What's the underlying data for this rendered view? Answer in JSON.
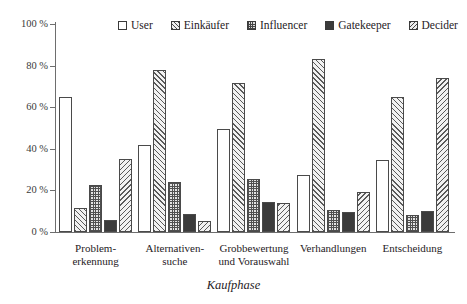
{
  "chart_data": {
    "type": "bar",
    "title": "",
    "subtitle": "",
    "xlabel": "Kaufphase",
    "ylabel": "",
    "ylim": [
      0,
      100
    ],
    "yunit": "%",
    "grid": false,
    "legend_position": "top",
    "categories": [
      "Problem-\nerkennung",
      "Alternativen-\nsuche",
      "Grobbewertung\nund Vorauswahl",
      "Verhandlungen",
      "Entscheidung"
    ],
    "series": [
      {
        "name": "User",
        "pattern": "open",
        "values": [
          65,
          42,
          49.5,
          27.5,
          34.5
        ]
      },
      {
        "name": "Einkäufer",
        "pattern": "diagonal-up",
        "values": [
          11.5,
          78,
          71.5,
          83,
          65
        ]
      },
      {
        "name": "Influencer",
        "pattern": "crosshatch",
        "values": [
          22.5,
          24,
          25.5,
          10.5,
          8
        ]
      },
      {
        "name": "Gatekeeper",
        "pattern": "solid",
        "values": [
          6,
          8.5,
          14.5,
          9.5,
          10
        ]
      },
      {
        "name": "Decider",
        "pattern": "diagonal-down",
        "values": [
          35,
          5.5,
          14,
          19,
          74
        ]
      }
    ],
    "yticks": [
      {
        "value": 100,
        "label": "100 %"
      },
      {
        "value": 80,
        "label": "80 %"
      },
      {
        "value": 60,
        "label": "60 %"
      },
      {
        "value": 40,
        "label": "40 %"
      },
      {
        "value": 20,
        "label": "20 %"
      },
      {
        "value": 0,
        "label": "0 %"
      }
    ]
  },
  "legend": {
    "items": [
      {
        "label": "User",
        "swatch": "legend-swatch-user"
      },
      {
        "label": "Einkäufer",
        "swatch": "legend-swatch-einkaeufer"
      },
      {
        "label": "Influencer",
        "swatch": "legend-swatch-influencer"
      },
      {
        "label": "Gatekeeper",
        "swatch": "legend-swatch-gatekeeper"
      },
      {
        "label": "Decider",
        "swatch": "legend-swatch-decider"
      }
    ]
  },
  "category_lines": [
    [
      "Problem-",
      "erkennung"
    ],
    [
      "Alternativen-",
      "suche"
    ],
    [
      "Grobbewertung",
      "und Vorauswahl"
    ],
    [
      "Verhandlungen",
      ""
    ],
    [
      "Entscheidung",
      ""
    ]
  ],
  "colors": {
    "axis": "#6e6e6e",
    "bar_outline": "#4a4a4a",
    "solid_fill": "#3b3b3b",
    "text": "#26211e",
    "background": "#ffffff"
  }
}
